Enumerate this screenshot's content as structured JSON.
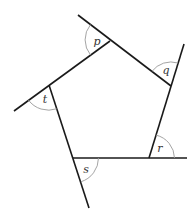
{
  "diagram": {
    "type": "pentagon-exterior-angles",
    "angles": [
      {
        "label": "p"
      },
      {
        "label": "q"
      },
      {
        "label": "r"
      },
      {
        "label": "s"
      },
      {
        "label": "t"
      }
    ],
    "colors": {
      "edge": "#1a1a1a",
      "arc": "#9a9a9a",
      "label": "#333333"
    }
  }
}
